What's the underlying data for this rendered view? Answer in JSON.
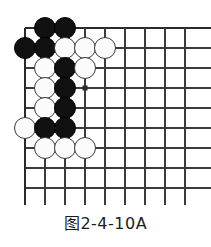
{
  "figure": {
    "caption": "图2-4-10A",
    "kind": "go-board-diagram"
  },
  "board": {
    "origin_x": 25,
    "origin_y": 28,
    "spacing": 20,
    "columns": 9,
    "rows": 9,
    "line_color": "#3b3b3b",
    "edge_line_color": "#2a2a2a",
    "background_color": "#ffffff",
    "stone_radius": 11,
    "black_color": "#111111",
    "white_color": "#fbfbfb",
    "white_border_color": "#3a3a3a",
    "star_points": [
      {
        "col": 4,
        "row": 4
      }
    ],
    "stones": [
      {
        "color": "black",
        "col": 2,
        "row": 1
      },
      {
        "color": "black",
        "col": 3,
        "row": 1
      },
      {
        "color": "black",
        "col": 1,
        "row": 2
      },
      {
        "color": "black",
        "col": 2,
        "row": 2
      },
      {
        "color": "white",
        "col": 3,
        "row": 2
      },
      {
        "color": "white",
        "col": 4,
        "row": 2
      },
      {
        "color": "white",
        "col": 5,
        "row": 2
      },
      {
        "color": "white",
        "col": 2,
        "row": 3
      },
      {
        "color": "black",
        "col": 3,
        "row": 3
      },
      {
        "color": "white",
        "col": 4,
        "row": 3
      },
      {
        "color": "white",
        "col": 2,
        "row": 4
      },
      {
        "color": "black",
        "col": 3,
        "row": 4
      },
      {
        "color": "white",
        "col": 2,
        "row": 5
      },
      {
        "color": "black",
        "col": 3,
        "row": 5
      },
      {
        "color": "white",
        "col": 1,
        "row": 6
      },
      {
        "color": "black",
        "col": 2,
        "row": 6
      },
      {
        "color": "black",
        "col": 3,
        "row": 6
      },
      {
        "color": "white",
        "col": 2,
        "row": 7
      },
      {
        "color": "white",
        "col": 3,
        "row": 7
      },
      {
        "color": "white",
        "col": 4,
        "row": 7
      }
    ]
  }
}
